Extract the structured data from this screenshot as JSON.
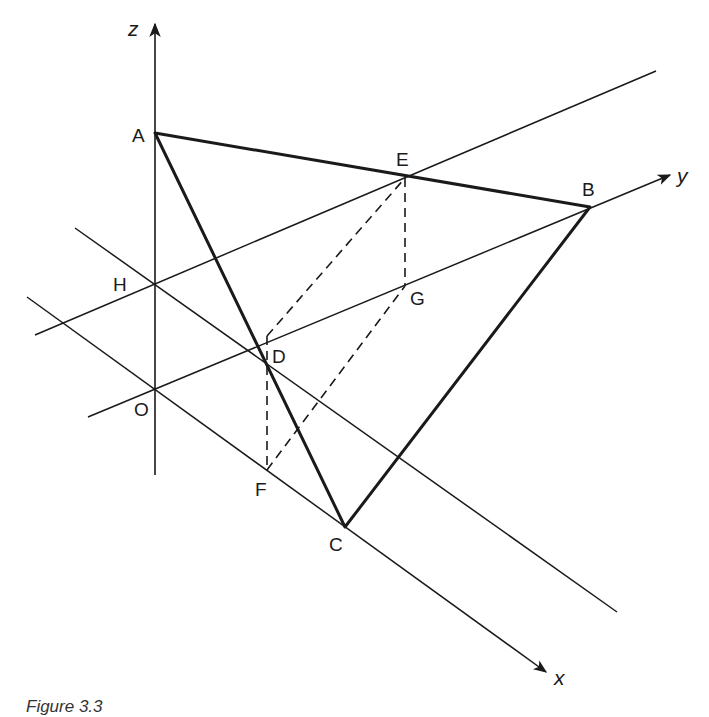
{
  "figure": {
    "caption": "Figure 3.3",
    "axes": {
      "x": {
        "label": "x"
      },
      "y": {
        "label": "y"
      },
      "z": {
        "label": "z"
      }
    },
    "points": {
      "A": {
        "label": "A"
      },
      "B": {
        "label": "B"
      },
      "C": {
        "label": "C"
      },
      "D": {
        "label": "D"
      },
      "E": {
        "label": "E"
      },
      "F": {
        "label": "F"
      },
      "G": {
        "label": "G"
      },
      "H": {
        "label": "H"
      },
      "O": {
        "label": "O"
      }
    },
    "triangle": [
      "A",
      "B",
      "C"
    ],
    "dashed_segments": [
      [
        "E",
        "G"
      ],
      [
        "D",
        "E"
      ],
      [
        "D",
        "F"
      ],
      [
        "F",
        "G"
      ]
    ],
    "colors": {
      "stroke": "#1a1a1a",
      "background": "#ffffff"
    }
  }
}
